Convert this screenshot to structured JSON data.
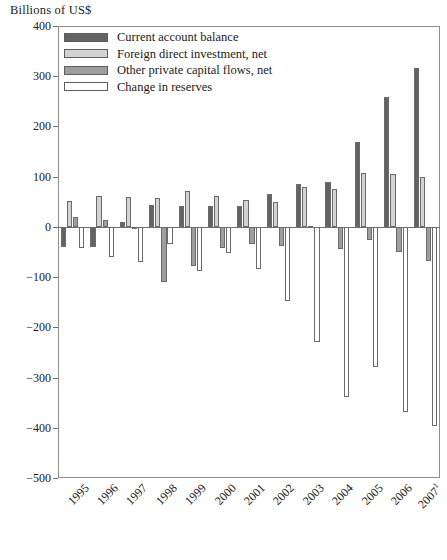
{
  "figure": {
    "y_axis_title": "Billions of US$"
  },
  "legend": {
    "position": "top-left-inside",
    "items": [
      {
        "label": "Current account balance",
        "key": "current_account_balance",
        "color": "#636363"
      },
      {
        "label": "Foreign direct investment, net",
        "key": "foreign_direct_investment",
        "color": "#d3d3d3"
      },
      {
        "label": "Other private capital flows, net",
        "key": "other_private_capital_flows",
        "color": "#9e9e9e"
      },
      {
        "label": "Change in reserves",
        "key": "change_in_reserves",
        "color": "#ffffff"
      }
    ]
  },
  "axes": {
    "y_ticks": [
      "400",
      "300",
      "200",
      "100",
      "0",
      "−100",
      "−200",
      "−300",
      "−400",
      "−500"
    ],
    "y_tick_values": [
      400,
      300,
      200,
      100,
      0,
      -100,
      -200,
      -300,
      -400,
      -500
    ],
    "y_min": -500,
    "y_max": 400,
    "x_labels": [
      "1995",
      "1996",
      "1997",
      "1998",
      "1999",
      "2000",
      "2001",
      "2002",
      "2003",
      "2004",
      "2005",
      "2006",
      "2007"
    ],
    "x_last_label_superscript": "1"
  },
  "chart_data": {
    "type": "bar",
    "title": "",
    "subtitle": "",
    "xlabel": "",
    "ylabel": "Billions of US$",
    "ylim": [
      -500,
      400
    ],
    "yticks": [
      400,
      300,
      200,
      100,
      0,
      -100,
      -200,
      -300,
      -400,
      -500
    ],
    "grid": false,
    "legend_position": "upper left inside plot",
    "note": "Last category 2007 carries a footnote marker ¹",
    "categories": [
      "1995",
      "1996",
      "1997",
      "1998",
      "1999",
      "2000",
      "2001",
      "2002",
      "2003",
      "2004",
      "2005",
      "2006",
      "2007"
    ],
    "series": [
      {
        "name": "Current account balance",
        "color": "#636363",
        "values": [
          -40,
          -40,
          10,
          44,
          42,
          41,
          42,
          66,
          85,
          89,
          170,
          258,
          316
        ]
      },
      {
        "name": "Foreign direct investment, net",
        "color": "#d3d3d3",
        "values": [
          52,
          62,
          60,
          58,
          72,
          62,
          53,
          50,
          80,
          76,
          107,
          105,
          99
        ]
      },
      {
        "name": "Other private capital flows, net",
        "color": "#9e9e9e",
        "values": [
          19,
          14,
          -5,
          -110,
          -78,
          -43,
          -34,
          -38,
          1,
          -45,
          -26,
          -50,
          -68
        ]
      },
      {
        "name": "Change in reserves",
        "color": "#ffffff",
        "values": [
          -42,
          -60,
          -70,
          -34,
          -88,
          -53,
          -83,
          -148,
          -230,
          -339,
          -280,
          -368,
          -397
        ]
      }
    ]
  }
}
